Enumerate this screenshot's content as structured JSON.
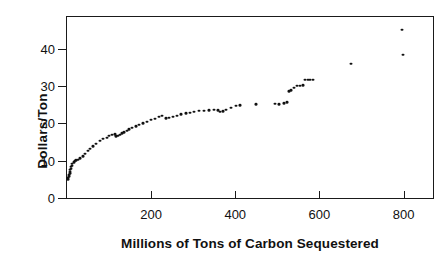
{
  "chart_data": {
    "type": "scatter",
    "title": "",
    "xlabel": "Millions of Tons of Carbon Sequestered",
    "ylabel": "Dollars/Ton",
    "xlim": [
      0,
      870
    ],
    "ylim": [
      0,
      48.5
    ],
    "xticks": [
      200,
      400,
      600,
      800
    ],
    "xtick_labels": [
      "200",
      "400",
      "600",
      "800"
    ],
    "yticks": [
      0,
      10,
      20,
      30,
      40
    ],
    "ytick_labels": [
      "0",
      "10",
      "20",
      "30",
      "40"
    ],
    "grid": false,
    "legend": null,
    "marker": {
      "shape": "dot",
      "color": "#111111",
      "size": 3
    },
    "series": [
      {
        "name": "Carbon sequestration supply curve",
        "points": [
          [
            2,
            5.0
          ],
          [
            3,
            5.4
          ],
          [
            4,
            5.8
          ],
          [
            5,
            6.2
          ],
          [
            6,
            6.6
          ],
          [
            7,
            7.1
          ],
          [
            8,
            7.5
          ],
          [
            9,
            7.9
          ],
          [
            10,
            8.3
          ],
          [
            11,
            8.7
          ],
          [
            13,
            9.2
          ],
          [
            16,
            9.6
          ],
          [
            19,
            9.9
          ],
          [
            22,
            10.1
          ],
          [
            26,
            10.3
          ],
          [
            31,
            10.6
          ],
          [
            37,
            11.2
          ],
          [
            43,
            11.9
          ],
          [
            49,
            12.6
          ],
          [
            55,
            13.2
          ],
          [
            62,
            13.9
          ],
          [
            70,
            14.6
          ],
          [
            78,
            15.3
          ],
          [
            86,
            15.8
          ],
          [
            94,
            16.2
          ],
          [
            101,
            16.6
          ],
          [
            108,
            16.9
          ],
          [
            113,
            17.1
          ],
          [
            117,
            16.5
          ],
          [
            121,
            16.6
          ],
          [
            126,
            17.0
          ],
          [
            131,
            17.3
          ],
          [
            136,
            17.6
          ],
          [
            142,
            18.0
          ],
          [
            148,
            18.4
          ],
          [
            155,
            18.8
          ],
          [
            163,
            19.2
          ],
          [
            171,
            19.6
          ],
          [
            180,
            20.0
          ],
          [
            190,
            20.4
          ],
          [
            200,
            20.9
          ],
          [
            210,
            21.3
          ],
          [
            219,
            21.7
          ],
          [
            227,
            22.0
          ],
          [
            235,
            21.4
          ],
          [
            243,
            21.5
          ],
          [
            252,
            21.8
          ],
          [
            262,
            22.1
          ],
          [
            272,
            22.4
          ],
          [
            282,
            22.7
          ],
          [
            292,
            22.9
          ],
          [
            302,
            23.1
          ],
          [
            313,
            23.3
          ],
          [
            325,
            23.4
          ],
          [
            338,
            23.5
          ],
          [
            350,
            23.6
          ],
          [
            358,
            23.5
          ],
          [
            364,
            23.1
          ],
          [
            370,
            23.2
          ],
          [
            378,
            23.6
          ],
          [
            390,
            24.2
          ],
          [
            402,
            24.7
          ],
          [
            412,
            24.8
          ],
          [
            450,
            25.1
          ],
          [
            495,
            25.2
          ],
          [
            505,
            25.1
          ],
          [
            515,
            25.4
          ],
          [
            523,
            25.6
          ],
          [
            528,
            28.6
          ],
          [
            533,
            28.9
          ],
          [
            540,
            29.6
          ],
          [
            547,
            30.0
          ],
          [
            554,
            30.1
          ],
          [
            560,
            30.2
          ],
          [
            566,
            31.6
          ],
          [
            572,
            31.7
          ],
          [
            578,
            31.6
          ],
          [
            584,
            31.7
          ],
          [
            676,
            36.0
          ],
          [
            797,
            45.0
          ],
          [
            799,
            38.4
          ]
        ]
      }
    ]
  },
  "axes": {
    "y_label_text": "Dollars/Ton",
    "x_label_text": "Millions of Tons of Carbon Sequestered"
  }
}
